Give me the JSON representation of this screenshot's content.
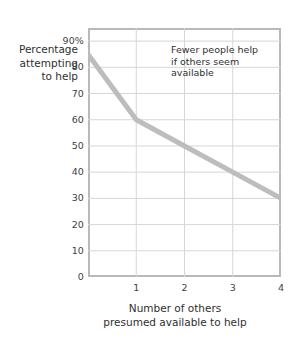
{
  "chart_data": {
    "type": "line",
    "title": "",
    "subtitle": "",
    "xlabel": "Number of others presumed available to help",
    "ylabel": "Percentage attempting to help",
    "x": [
      0,
      1,
      2,
      3,
      4
    ],
    "series": [
      {
        "name": "Percentage attempting to help",
        "values": [
          85,
          60,
          50,
          40,
          30
        ],
        "color": "#bdbdbd"
      }
    ],
    "xlim": [
      0,
      4
    ],
    "ylim": [
      0,
      95
    ],
    "xticks": [
      "1",
      "2",
      "3",
      "4"
    ],
    "xtick_values": [
      1,
      2,
      3,
      4
    ],
    "yticks": [
      "0",
      "10",
      "20",
      "30",
      "40",
      "50",
      "60",
      "70",
      "80",
      "90%"
    ],
    "ytick_values": [
      0,
      10,
      20,
      30,
      40,
      50,
      60,
      70,
      80,
      90
    ],
    "grid": true,
    "legend": "none",
    "annotations": [
      {
        "lines": [
          "Fewer people help",
          "if others seem",
          "available"
        ],
        "x": 2.4,
        "y": 88
      }
    ]
  },
  "axes": {
    "y_label_lines": [
      "Percentage",
      "attempting",
      "to help"
    ],
    "x_label_lines": [
      "Number of others",
      "presumed available to help"
    ]
  },
  "colors": {
    "line": "#bdbdbd",
    "frame": "#b9b9b9",
    "grid": "#d6d6d6",
    "text": "#3a3a3a",
    "background": "#ffffff"
  }
}
